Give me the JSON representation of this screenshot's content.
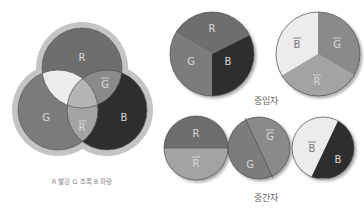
{
  "colors": {
    "red": "#6e6e6e",
    "green": "#7b7b7b",
    "blue": "#2e2e2e",
    "anti_red": "#a3a3a3",
    "anti_green": "#8a8a8a",
    "anti_blue": "#ececec",
    "white_center": "#b5b5b5",
    "halo": "#c4c4c4",
    "outline": "#555555"
  },
  "venn": {
    "labels": {
      "red": "R",
      "green": "G",
      "blue": "B",
      "anti_green": "G",
      "anti_red": "R"
    },
    "legend": "R 빨강  G 초록  B 파랑"
  },
  "baryons": {
    "caption": "중입자",
    "quark_circle": {
      "labels": [
        "R",
        "G",
        "B"
      ]
    },
    "antiquark_circle": {
      "labels": [
        "B",
        "G",
        "R"
      ],
      "anti": true
    }
  },
  "mesons": {
    "caption": "중간자",
    "pairs": [
      {
        "quark": "R",
        "antiquark": "R"
      },
      {
        "quark": "G",
        "antiquark": "G"
      },
      {
        "quark": "B",
        "antiquark": "B"
      }
    ]
  }
}
